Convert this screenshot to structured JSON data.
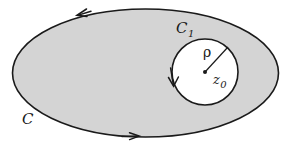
{
  "figure": {
    "background_color": "#ffffff",
    "region_fill_color": "#d4d4d4",
    "stroke_color": "#1a1a1a",
    "outer_contour": {
      "name": "C",
      "label": "C",
      "shape": "ellipse",
      "center_x": 145.5,
      "center_y": 73,
      "radius_x": 133,
      "radius_y": 64,
      "orientation": "counterclockwise",
      "label_x": 22,
      "label_y": 124,
      "arrows": [
        {
          "name": "top-arrow",
          "direction": "left",
          "x": 84,
          "y": 13
        },
        {
          "name": "bottom-arrow",
          "direction": "right",
          "x": 132,
          "y": 136
        }
      ]
    },
    "inner_contour": {
      "name": "C1",
      "label_main": "C",
      "label_sub": "1",
      "shape": "circle",
      "center_x": 205,
      "center_y": 72,
      "radius": 33,
      "fill_color": "#ffffff",
      "orientation": "clockwise",
      "label_x": 176,
      "label_y": 33,
      "arrow": {
        "name": "inner-arrow",
        "direction": "down",
        "x": 173,
        "y": 82
      }
    },
    "center_point": {
      "name": "z0",
      "label_main": "z",
      "label_sub": "0",
      "x": 205,
      "y": 72,
      "dot_radius": 2,
      "label_x": 213,
      "label_y": 84
    },
    "radius_marker": {
      "name": "rho",
      "label": "ρ",
      "from_x": 205,
      "from_y": 72,
      "to_x": 228,
      "to_y": 47,
      "label_x": 203,
      "label_y": 57
    }
  }
}
